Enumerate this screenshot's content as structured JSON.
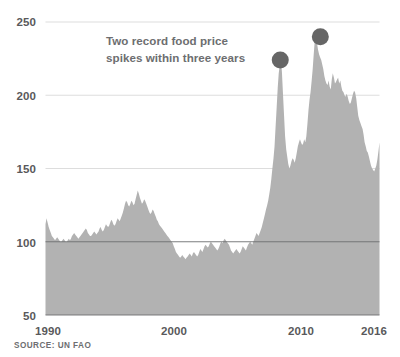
{
  "annotation": {
    "line1": "Two record food price",
    "line2": "spikes within three years"
  },
  "source": {
    "text": "SOURCE: UN FAO"
  },
  "colors": {
    "area_fill": "#b2b2b2",
    "marker": "#666666",
    "gridline_light": "#d9d9d9",
    "gridline_dark": "#6d6e70",
    "axis_text": "#59595b",
    "annotation_text": "#6d6e70",
    "background": "#ffffff"
  },
  "axes": {
    "y_ticks": [
      "250",
      "200",
      "150",
      "100",
      "50"
    ],
    "x_ticks": [
      "1990",
      "2000",
      "2010",
      "2016"
    ]
  },
  "chart_data": {
    "type": "area",
    "title": "",
    "subtitle": "",
    "xlabel": "",
    "ylabel": "",
    "xlim": [
      1990,
      2016.25
    ],
    "ylim": [
      50,
      250
    ],
    "grid": true,
    "legend": false,
    "source": "SOURCE: UN FAO",
    "annotations": [
      {
        "text": "Two record food price spikes within three years",
        "x": 1996.5,
        "y": 228
      },
      {
        "type": "marker-dot",
        "label": "2008 record spike",
        "x": 2008.45,
        "y": 224
      },
      {
        "type": "marker-dot",
        "label": "2011 record spike",
        "x": 2011.6,
        "y": 240
      }
    ],
    "y_ticks": [
      250,
      200,
      150,
      100,
      50
    ],
    "x_ticks": [
      1990,
      2000,
      2010,
      2016
    ],
    "series": [
      {
        "name": "FAO Food Price Index",
        "x": [
          1990.0,
          1990.08,
          1990.17,
          1990.25,
          1990.33,
          1990.42,
          1990.5,
          1990.58,
          1990.67,
          1990.75,
          1990.83,
          1990.92,
          1991.0,
          1991.08,
          1991.17,
          1991.25,
          1991.33,
          1991.42,
          1991.5,
          1991.58,
          1991.67,
          1991.75,
          1991.83,
          1991.92,
          1992.0,
          1992.08,
          1992.17,
          1992.25,
          1992.33,
          1992.42,
          1992.5,
          1992.58,
          1992.67,
          1992.75,
          1992.83,
          1992.92,
          1993.0,
          1993.08,
          1993.17,
          1993.25,
          1993.33,
          1993.42,
          1993.5,
          1993.58,
          1993.67,
          1993.75,
          1993.83,
          1993.92,
          1994.0,
          1994.08,
          1994.17,
          1994.25,
          1994.33,
          1994.42,
          1994.5,
          1994.58,
          1994.67,
          1994.75,
          1994.83,
          1994.92,
          1995.0,
          1995.08,
          1995.17,
          1995.25,
          1995.33,
          1995.42,
          1995.5,
          1995.58,
          1995.67,
          1995.75,
          1995.83,
          1995.92,
          1996.0,
          1996.08,
          1996.17,
          1996.25,
          1996.33,
          1996.42,
          1996.5,
          1996.58,
          1996.67,
          1996.75,
          1996.83,
          1996.92,
          1997.0,
          1997.08,
          1997.17,
          1997.25,
          1997.33,
          1997.42,
          1997.5,
          1997.58,
          1997.67,
          1997.75,
          1997.83,
          1997.92,
          1998.0,
          1998.08,
          1998.17,
          1998.25,
          1998.33,
          1998.42,
          1998.5,
          1998.58,
          1998.67,
          1998.75,
          1998.83,
          1998.92,
          1999.0,
          1999.08,
          1999.17,
          1999.25,
          1999.33,
          1999.42,
          1999.5,
          1999.58,
          1999.67,
          1999.75,
          1999.83,
          1999.92,
          2000.0,
          2000.08,
          2000.17,
          2000.25,
          2000.33,
          2000.42,
          2000.5,
          2000.58,
          2000.67,
          2000.75,
          2000.83,
          2000.92,
          2001.0,
          2001.08,
          2001.17,
          2001.25,
          2001.33,
          2001.42,
          2001.5,
          2001.58,
          2001.67,
          2001.75,
          2001.83,
          2001.92,
          2002.0,
          2002.08,
          2002.17,
          2002.25,
          2002.33,
          2002.42,
          2002.5,
          2002.58,
          2002.67,
          2002.75,
          2002.83,
          2002.92,
          2003.0,
          2003.08,
          2003.17,
          2003.25,
          2003.33,
          2003.42,
          2003.5,
          2003.58,
          2003.67,
          2003.75,
          2003.83,
          2003.92,
          2004.0,
          2004.08,
          2004.17,
          2004.25,
          2004.33,
          2004.42,
          2004.5,
          2004.58,
          2004.67,
          2004.75,
          2004.83,
          2004.92,
          2005.0,
          2005.08,
          2005.17,
          2005.25,
          2005.33,
          2005.42,
          2005.5,
          2005.58,
          2005.67,
          2005.75,
          2005.83,
          2005.92,
          2006.0,
          2006.08,
          2006.17,
          2006.25,
          2006.33,
          2006.42,
          2006.5,
          2006.58,
          2006.67,
          2006.75,
          2006.83,
          2006.92,
          2007.0,
          2007.08,
          2007.17,
          2007.25,
          2007.33,
          2007.42,
          2007.5,
          2007.58,
          2007.67,
          2007.75,
          2007.83,
          2007.92,
          2008.0,
          2008.08,
          2008.17,
          2008.25,
          2008.33,
          2008.42,
          2008.5,
          2008.58,
          2008.67,
          2008.75,
          2008.83,
          2008.92,
          2009.0,
          2009.08,
          2009.17,
          2009.25,
          2009.33,
          2009.42,
          2009.5,
          2009.58,
          2009.67,
          2009.75,
          2009.83,
          2009.92,
          2010.0,
          2010.08,
          2010.17,
          2010.25,
          2010.33,
          2010.42,
          2010.5,
          2010.58,
          2010.67,
          2010.75,
          2010.83,
          2010.92,
          2011.0,
          2011.08,
          2011.17,
          2011.25,
          2011.33,
          2011.42,
          2011.5,
          2011.58,
          2011.67,
          2011.75,
          2011.83,
          2011.92,
          2012.0,
          2012.08,
          2012.17,
          2012.25,
          2012.33,
          2012.42,
          2012.5,
          2012.58,
          2012.67,
          2012.75,
          2012.83,
          2012.92,
          2013.0,
          2013.08,
          2013.17,
          2013.25,
          2013.33,
          2013.42,
          2013.5,
          2013.58,
          2013.67,
          2013.75,
          2013.83,
          2013.92,
          2014.0,
          2014.08,
          2014.17,
          2014.25,
          2014.33,
          2014.42,
          2014.5,
          2014.58,
          2014.67,
          2014.75,
          2014.83,
          2014.92,
          2015.0,
          2015.08,
          2015.17,
          2015.25,
          2015.33,
          2015.42,
          2015.5,
          2015.58,
          2015.67,
          2015.75,
          2015.83,
          2015.92,
          2016.0,
          2016.08,
          2016.17,
          2016.25
        ],
        "values": [
          112,
          116,
          113,
          110,
          108,
          106,
          104,
          103,
          102,
          101,
          102,
          103,
          102,
          101,
          100,
          100,
          101,
          102,
          101,
          100,
          100,
          101,
          102,
          101,
          102,
          104,
          105,
          106,
          105,
          104,
          103,
          102,
          103,
          104,
          105,
          106,
          107,
          108,
          109,
          108,
          106,
          105,
          104,
          104,
          105,
          106,
          107,
          106,
          105,
          106,
          107,
          109,
          110,
          108,
          107,
          108,
          110,
          112,
          111,
          110,
          111,
          113,
          115,
          114,
          112,
          111,
          112,
          114,
          116,
          115,
          114,
          116,
          118,
          120,
          123,
          126,
          128,
          127,
          125,
          124,
          126,
          128,
          127,
          125,
          126,
          129,
          132,
          135,
          133,
          130,
          128,
          126,
          127,
          129,
          128,
          126,
          124,
          122,
          120,
          119,
          120,
          122,
          121,
          119,
          117,
          115,
          114,
          112,
          111,
          110,
          109,
          108,
          107,
          106,
          105,
          104,
          103,
          102,
          101,
          100,
          99,
          97,
          95,
          93,
          92,
          91,
          90,
          89,
          90,
          91,
          90,
          89,
          88,
          89,
          90,
          91,
          92,
          91,
          90,
          92,
          93,
          92,
          91,
          90,
          91,
          93,
          95,
          94,
          93,
          95,
          97,
          98,
          97,
          96,
          97,
          99,
          100,
          99,
          98,
          97,
          96,
          95,
          94,
          95,
          97,
          99,
          100,
          99,
          101,
          102,
          101,
          100,
          99,
          98,
          96,
          94,
          93,
          92,
          93,
          94,
          95,
          94,
          93,
          92,
          93,
          95,
          97,
          96,
          95,
          94,
          96,
          98,
          99,
          100,
          99,
          98,
          100,
          102,
          104,
          106,
          105,
          104,
          106,
          108,
          110,
          113,
          116,
          119,
          122,
          125,
          128,
          132,
          137,
          143,
          150,
          157,
          165,
          178,
          192,
          205,
          215,
          221,
          224,
          216,
          200,
          186,
          172,
          163,
          158,
          153,
          150,
          152,
          155,
          157,
          156,
          154,
          157,
          161,
          165,
          168,
          170,
          168,
          166,
          167,
          170,
          168,
          172,
          180,
          190,
          197,
          202,
          210,
          218,
          228,
          238,
          240,
          236,
          231,
          228,
          226,
          224,
          221,
          218,
          213,
          210,
          208,
          207,
          210,
          206,
          204,
          211,
          215,
          212,
          208,
          209,
          211,
          212,
          208,
          210,
          206,
          203,
          202,
          200,
          199,
          201,
          199,
          196,
          194,
          195,
          198,
          201,
          203,
          202,
          198,
          192,
          186,
          183,
          181,
          179,
          177,
          173,
          168,
          165,
          162,
          161,
          158,
          155,
          152,
          150,
          149,
          148,
          150,
          152,
          156,
          162,
          168
        ]
      }
    ]
  }
}
